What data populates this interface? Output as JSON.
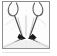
{
  "figure": {
    "kind": "framed-line-drawing",
    "caption": "",
    "frame": {
      "border_color": "#8e8e8e",
      "background_color": "#fdfdfd",
      "x": 2,
      "y": 1,
      "width": 48,
      "height": 48
    },
    "ink_color": "#4a4a4a",
    "fill_color": "#1a1a1a",
    "faint_color": "#b9b9b9",
    "elements": [
      {
        "name": "left-hook-curve",
        "label": "left hook curve"
      },
      {
        "name": "right-hook-curve",
        "label": "right hook curve"
      },
      {
        "name": "central-funnel",
        "label": "central funnel"
      },
      {
        "name": "left-dark-wedge",
        "label": "left dark wedge"
      },
      {
        "name": "right-dark-wedge",
        "label": "right dark wedge"
      },
      {
        "name": "left-diagonal-line",
        "label": "left diagonal line"
      },
      {
        "name": "right-diagonal-line",
        "label": "right diagonal line"
      },
      {
        "name": "stipple-texture",
        "label": "stipple texture"
      }
    ]
  },
  "chart_data": {
    "type": "line",
    "title": "",
    "xlabel": "",
    "ylabel": "",
    "xlim": [
      0,
      48
    ],
    "ylim": [
      0,
      48
    ],
    "grid": false,
    "legend": "none",
    "series": [
      {
        "name": "left-hook-curve",
        "points": [
          [
            6,
            2
          ],
          [
            5,
            8
          ],
          [
            7,
            13
          ],
          [
            11,
            15
          ],
          [
            15,
            12
          ],
          [
            16,
            6
          ],
          [
            14,
            2
          ]
        ]
      },
      {
        "name": "right-hook-curve",
        "points": [
          [
            42,
            2
          ],
          [
            43,
            8
          ],
          [
            41,
            13
          ],
          [
            36,
            15
          ],
          [
            32,
            12
          ],
          [
            31,
            6
          ],
          [
            33,
            2
          ]
        ]
      },
      {
        "name": "left-funnel-wall",
        "points": [
          [
            12,
            15
          ],
          [
            15,
            22
          ],
          [
            18,
            30
          ],
          [
            20,
            36
          ]
        ]
      },
      {
        "name": "right-funnel-wall",
        "points": [
          [
            36,
            15
          ],
          [
            33,
            22
          ],
          [
            30,
            30
          ],
          [
            28,
            36
          ]
        ]
      },
      {
        "name": "left-diagonal-line",
        "points": [
          [
            20,
            38
          ],
          [
            10,
            44
          ],
          [
            2,
            48
          ]
        ]
      },
      {
        "name": "right-diagonal-line",
        "points": [
          [
            30,
            38
          ],
          [
            40,
            44
          ],
          [
            48,
            48
          ]
        ]
      }
    ],
    "shapes": [
      {
        "name": "left-dark-wedge",
        "polygon": [
          [
            17,
            33
          ],
          [
            24,
            38
          ],
          [
            18,
            40
          ],
          [
            15,
            37
          ]
        ]
      },
      {
        "name": "right-dark-wedge",
        "polygon": [
          [
            31,
            33
          ],
          [
            26,
            38
          ],
          [
            32,
            40
          ],
          [
            35,
            37
          ]
        ]
      }
    ]
  }
}
